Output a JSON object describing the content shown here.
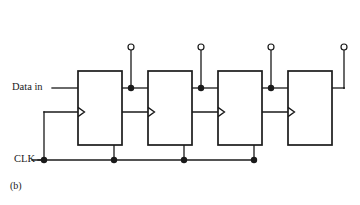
{
  "figure": {
    "caption": "(b)",
    "background": "#ffffff",
    "ink": "#1a1a1a"
  },
  "signals": {
    "data_in_label": "Data in",
    "clk_label": "CLK"
  },
  "flipflops": [
    {
      "name": "ff0",
      "d_label": "D",
      "c_label": "C",
      "x": 78,
      "y": 71,
      "w": 44,
      "h": 74,
      "clk_riser_x": 44,
      "out_tap_x": 131
    },
    {
      "name": "ff1",
      "d_label": "D",
      "c_label": "C",
      "x": 148,
      "y": 71,
      "w": 44,
      "h": 74,
      "clk_riser_x": 114,
      "out_tap_x": 201
    },
    {
      "name": "ff2",
      "d_label": "D",
      "c_label": "C",
      "x": 218,
      "y": 71,
      "w": 44,
      "h": 74,
      "clk_riser_x": 184,
      "out_tap_x": 271
    },
    {
      "name": "ff3",
      "d_label": "D",
      "c_label": "C",
      "x": 288,
      "y": 71,
      "w": 44,
      "h": 74,
      "clk_riser_x": 254,
      "out_tap_x": 344
    }
  ],
  "outputs": [
    {
      "name": "q0",
      "label": "Q",
      "subscript": "0",
      "x": 131,
      "terminal_y": 47,
      "label_y": 27
    },
    {
      "name": "q1",
      "label": "Q",
      "subscript": "1",
      "x": 201,
      "terminal_y": 47,
      "label_y": 27
    },
    {
      "name": "q2",
      "label": "Q",
      "subscript": "2",
      "x": 271,
      "terminal_y": 47,
      "label_y": 27
    },
    {
      "name": "q3",
      "label": "Q",
      "subscript": "3",
      "x": 344,
      "terminal_y": 47,
      "label_y": 27
    }
  ],
  "geometry": {
    "d_input_y": 88,
    "c_input_y": 112,
    "clk_bus_y": 160,
    "clk_bus_start_x": 44,
    "clk_bus_end_x": 254,
    "data_in_wire_start_x": 52,
    "terminal_radius": 3,
    "junction_radius": 3.2
  }
}
